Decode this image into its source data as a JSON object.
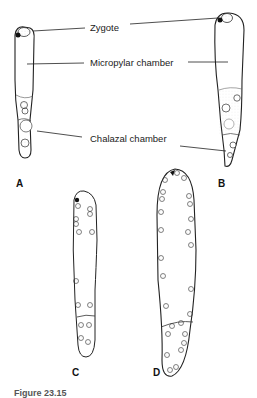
{
  "labels": {
    "zygote": "Zygote",
    "micropylar": "Micropylar chamber",
    "chalazal": "Chalazal chamber"
  },
  "panels": {
    "a": "A",
    "b": "B",
    "c": "C",
    "d": "D"
  },
  "caption": "Figure 23.15"
}
